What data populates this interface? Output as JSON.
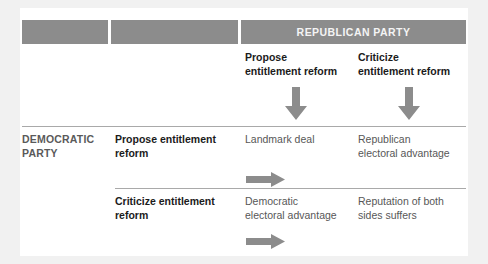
{
  "figure": {
    "type": "payoff-matrix",
    "colors": {
      "page_background": "#f1f1f1",
      "panel_background": "#ffffff",
      "banner_grey": "#8c8c8c",
      "arrow_grey": "#8c8c8c",
      "divider_grey": "#a9a9a9",
      "heading_black": "#1b1b1b",
      "body_grey": "#575757",
      "party_label_grey": "#5a5a5a",
      "banner_text": "#f4f4f4"
    }
  },
  "banner": {
    "segments": [
      {
        "name": "blank-1",
        "label": ""
      },
      {
        "name": "blank-2",
        "label": ""
      },
      {
        "name": "republican",
        "label": "REPUBLICAN PARTY"
      }
    ],
    "republican_party_label": "REPUBLICAN PARTY"
  },
  "column_headers": [
    {
      "name": "propose",
      "label": "Propose\nentitlement reform"
    },
    {
      "name": "criticize",
      "label": "Criticize\nentitlement reform"
    }
  ],
  "column_header_propose_line_1": "Propose",
  "column_header_propose_line_2": "entitlement reform",
  "column_header_criticize_line_1": "Criticize",
  "column_header_criticize_line_2": "entitlement reform",
  "row_party": {
    "label_line_1": "DEMOCRATIC",
    "label_line_2": "PARTY"
  },
  "rows": [
    {
      "name": "propose",
      "strategy_line_1": "Propose entitlement",
      "strategy_line_2": "reform",
      "cells": [
        {
          "line_1": "Landmark deal",
          "line_2": ""
        },
        {
          "line_1": "Republican",
          "line_2": "electoral advantage"
        }
      ]
    },
    {
      "name": "criticize",
      "strategy_line_1": "Criticize entitlement",
      "strategy_line_2": "reform",
      "cells": [
        {
          "line_1": "Democratic",
          "line_2": "electoral advantage"
        },
        {
          "line_1": "Reputation of both",
          "line_2": "sides suffers"
        }
      ]
    }
  ],
  "icons": {
    "arrow_down_propose": "arrow-down-icon",
    "arrow_down_criticize": "arrow-down-icon",
    "arrow_right_row_1": "arrow-right-icon",
    "arrow_right_row_2": "arrow-right-icon"
  }
}
